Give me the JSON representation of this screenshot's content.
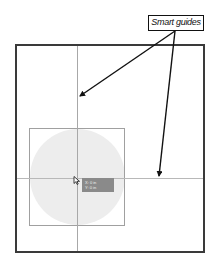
{
  "callout": {
    "label": "Smart guides"
  },
  "tooltip": {
    "line1": "X: 0 in",
    "line2": "Y: 0 in"
  },
  "colors": {
    "artboard_border": "#3a3a3a",
    "guide": "#a8a8a8",
    "circle_fill": "#ededed",
    "selection_border": "#a0a0a0",
    "tooltip_bg": "#8a8a8a",
    "arrow": "#111111"
  },
  "icons": {
    "cursor": "arrow-pointer-icon"
  }
}
